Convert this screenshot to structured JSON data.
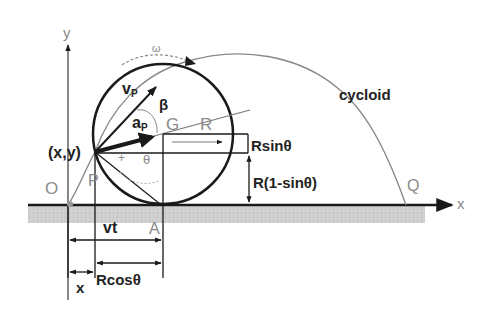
{
  "diagram": {
    "axes": {
      "x_label": "x",
      "y_label": "y",
      "origin_label": "O"
    },
    "curve_label": "cycloid",
    "points": {
      "point_xy": "(x,y)",
      "point_p": "P",
      "center": "G",
      "contact": "A",
      "end": "Q"
    },
    "symbols": {
      "omega": "ω",
      "velocity": "v",
      "velocity_sub": "P",
      "acceleration": "a",
      "acceleration_sub": "P",
      "beta": "β",
      "theta": "θ",
      "radius": "R"
    },
    "dimensions": {
      "r_sin": "Rsinθ",
      "r_one_minus_sin": "R(1-sinθ)",
      "vt": "vt",
      "x": "x",
      "r_cos": "Rcosθ"
    },
    "colors": {
      "line": "#1a1a1a",
      "thin_line": "#777777",
      "ground": "#c8c8c8",
      "label_grey": "#8a8a8a"
    }
  }
}
